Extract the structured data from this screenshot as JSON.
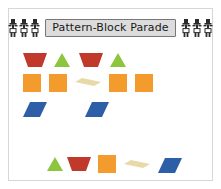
{
  "worksheet": {
    "title": "Pattern-Block Parade",
    "decor_icon_left": "marching-band-figures-icon",
    "decor_icon_right": "marching-band-figures-icon",
    "marchers_per_group": 3
  },
  "palette": {
    "red_trapezoid": "#c0392b",
    "green_triangle": "#8cc63e",
    "orange_square": "#f39c2d",
    "tan_rhombus": "#e8d9a8",
    "blue_parallelogram": "#2d5fa8",
    "plate_fill": "#dcdcdc",
    "plate_border": "#777777",
    "frame_border": "#d9d6cf",
    "page_background": "#ffffff"
  },
  "pattern_rows": [
    {
      "name": "row-1",
      "cells": [
        {
          "shape": "trapezoid",
          "color": "#c0392b",
          "x": 14
        },
        {
          "shape": "triangle",
          "color": "#8cc63e",
          "x": 45
        },
        {
          "shape": "trapezoid",
          "color": "#c0392b",
          "x": 70
        },
        {
          "shape": "triangle",
          "color": "#8cc63e",
          "x": 101
        }
      ]
    },
    {
      "name": "row-2",
      "cells": [
        {
          "shape": "square",
          "color": "#f39c2d",
          "x": 14
        },
        {
          "shape": "square",
          "color": "#f39c2d",
          "x": 40
        },
        {
          "shape": "rhombus",
          "color": "#e8d9a8",
          "x": 66
        },
        {
          "shape": "square",
          "color": "#f39c2d",
          "x": 100
        },
        {
          "shape": "square",
          "color": "#f39c2d",
          "x": 126
        }
      ]
    },
    {
      "name": "row-3",
      "cells": [
        {
          "shape": "parallelogram",
          "color": "#2d5fa8",
          "x": 14
        },
        {
          "shape": "parallelogram",
          "color": "#2d5fa8",
          "x": 76
        }
      ]
    }
  ],
  "answer_row": {
    "name": "answer-row",
    "cells": [
      {
        "shape": "triangle",
        "color": "#8cc63e",
        "x": 38
      },
      {
        "shape": "trapezoid",
        "color": "#c0392b",
        "x": 58
      },
      {
        "shape": "square",
        "color": "#f39c2d",
        "x": 89
      },
      {
        "shape": "rhombus",
        "color": "#e8d9a8",
        "x": 115
      },
      {
        "shape": "parallelogram",
        "color": "#2d5fa8",
        "x": 149
      }
    ]
  }
}
